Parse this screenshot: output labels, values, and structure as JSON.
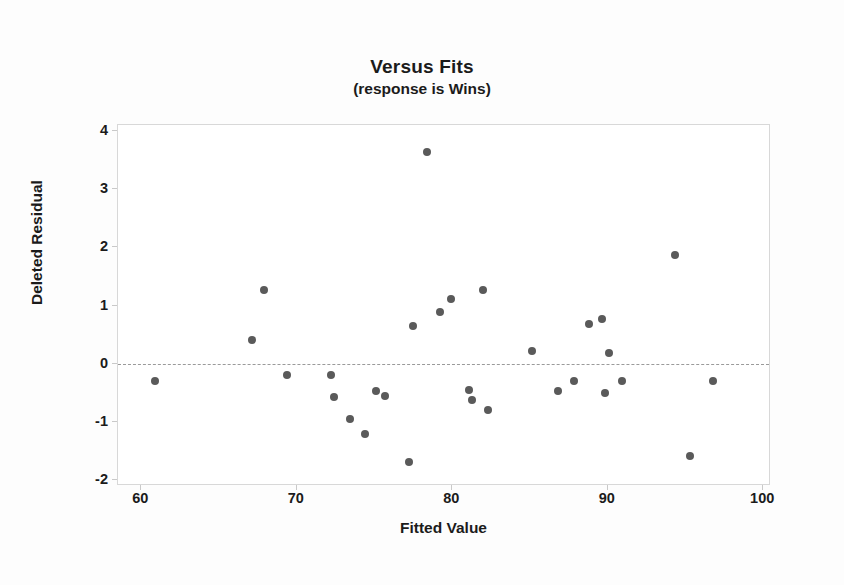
{
  "chart_data": {
    "type": "scatter",
    "title": "Versus Fits",
    "subtitle": "(response is Wins)",
    "xlabel": "Fitted Value",
    "ylabel": "Deleted Residual",
    "xlim": [
      58.5,
      100.5
    ],
    "ylim": [
      -2.1,
      4.1
    ],
    "xticks": [
      60,
      70,
      80,
      90,
      100
    ],
    "yticks": [
      -2,
      -1,
      0,
      1,
      2,
      3,
      4
    ],
    "grid": false,
    "legend": null,
    "reference_line": {
      "axis": "y",
      "value": 0,
      "style": "dashed",
      "color": "#9a9a9a"
    },
    "marker": {
      "shape": "circle",
      "color": "#5a5a5a",
      "size": 8
    },
    "series": [
      {
        "name": "Deleted Residual vs Fitted Value",
        "points": [
          {
            "x": 60.9,
            "y": -0.29
          },
          {
            "x": 67.1,
            "y": 0.4
          },
          {
            "x": 67.9,
            "y": 1.27
          },
          {
            "x": 69.4,
            "y": -0.19
          },
          {
            "x": 72.2,
            "y": -0.2
          },
          {
            "x": 72.4,
            "y": -0.57
          },
          {
            "x": 73.4,
            "y": -0.95
          },
          {
            "x": 74.4,
            "y": -1.21
          },
          {
            "x": 75.1,
            "y": -0.46
          },
          {
            "x": 75.7,
            "y": -0.55
          },
          {
            "x": 77.2,
            "y": -1.68
          },
          {
            "x": 77.5,
            "y": 0.65
          },
          {
            "x": 78.4,
            "y": 3.63
          },
          {
            "x": 79.2,
            "y": 0.88
          },
          {
            "x": 79.9,
            "y": 1.11
          },
          {
            "x": 81.1,
            "y": -0.45
          },
          {
            "x": 81.3,
            "y": -0.63
          },
          {
            "x": 82.0,
            "y": 1.27
          },
          {
            "x": 82.3,
            "y": -0.79
          },
          {
            "x": 85.1,
            "y": 0.21
          },
          {
            "x": 86.8,
            "y": -0.46
          },
          {
            "x": 87.8,
            "y": -0.29
          },
          {
            "x": 88.8,
            "y": 0.68
          },
          {
            "x": 89.6,
            "y": 0.76
          },
          {
            "x": 89.8,
            "y": -0.5
          },
          {
            "x": 90.1,
            "y": 0.18
          },
          {
            "x": 90.9,
            "y": -0.29
          },
          {
            "x": 94.3,
            "y": 1.86
          },
          {
            "x": 95.3,
            "y": -1.59
          },
          {
            "x": 96.8,
            "y": -0.29
          }
        ]
      }
    ]
  },
  "axis_titles": {
    "x": "Fitted Value",
    "y": "Deleted Residual"
  }
}
